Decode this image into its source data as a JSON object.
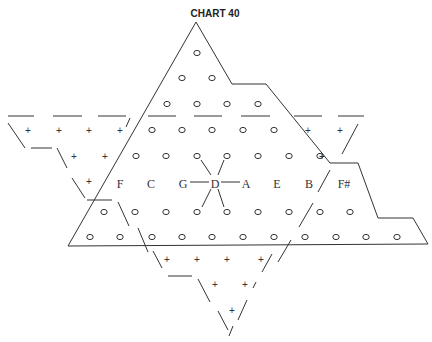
{
  "title": "CHART 40",
  "colors": {
    "ink": "#333333",
    "background": "#ffffff"
  },
  "center_note": "D",
  "note_labels": [
    {
      "text": "F",
      "x": 120,
      "y": 184
    },
    {
      "text": "C",
      "x": 151,
      "y": 184
    },
    {
      "text": "G",
      "x": 183,
      "y": 184
    },
    {
      "text": "D",
      "x": 215,
      "y": 184
    },
    {
      "text": "A",
      "x": 246,
      "y": 184
    },
    {
      "text": "E",
      "x": 277,
      "y": 184
    },
    {
      "text": "B",
      "x": 309,
      "y": 184
    },
    {
      "text": "F#",
      "x": 344,
      "y": 184
    }
  ],
  "circles": [
    [
      197,
      53
    ],
    [
      182,
      78
    ],
    [
      212,
      78
    ],
    [
      167,
      104
    ],
    [
      197,
      104
    ],
    [
      227,
      104
    ],
    [
      258,
      104
    ],
    [
      152,
      130
    ],
    [
      182,
      130
    ],
    [
      212,
      130
    ],
    [
      243,
      130
    ],
    [
      274,
      130
    ],
    [
      136,
      156
    ],
    [
      166,
      156
    ],
    [
      197,
      156
    ],
    [
      227,
      156
    ],
    [
      258,
      156
    ],
    [
      289,
      156
    ],
    [
      320,
      156
    ],
    [
      104,
      212
    ],
    [
      135,
      212
    ],
    [
      166,
      212
    ],
    [
      197,
      212
    ],
    [
      227,
      212
    ],
    [
      258,
      212
    ],
    [
      289,
      212
    ],
    [
      320,
      212
    ],
    [
      350,
      212
    ],
    [
      90,
      237
    ],
    [
      120,
      237
    ],
    [
      152,
      237
    ],
    [
      182,
      237
    ],
    [
      212,
      237
    ],
    [
      243,
      237
    ],
    [
      274,
      237
    ],
    [
      305,
      237
    ],
    [
      336,
      237
    ],
    [
      366,
      237
    ],
    [
      397,
      237
    ]
  ],
  "center_ray_circles": [
    [
      197,
      156
    ],
    [
      227,
      156
    ],
    [
      197,
      212
    ],
    [
      227,
      212
    ]
  ],
  "pluses": [
    [
      28,
      131
    ],
    [
      59,
      131
    ],
    [
      89,
      131
    ],
    [
      120,
      131
    ],
    [
      74,
      157
    ],
    [
      105,
      157
    ],
    [
      89,
      182
    ],
    [
      308,
      131
    ],
    [
      340,
      131
    ],
    [
      322,
      157
    ],
    [
      167,
      260
    ],
    [
      197,
      260
    ],
    [
      227,
      260
    ],
    [
      261,
      260
    ],
    [
      215,
      285
    ],
    [
      245,
      285
    ],
    [
      232,
      311
    ]
  ]
}
